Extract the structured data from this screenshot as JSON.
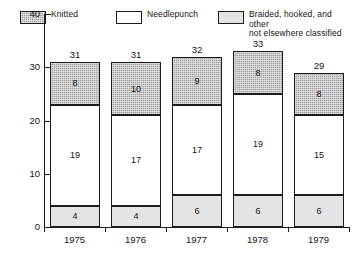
{
  "chart_data": {
    "type": "bar",
    "subtype": "stacked",
    "title": "",
    "xlabel": "",
    "ylabel": "",
    "categories": [
      "1975",
      "1976",
      "1977",
      "1978",
      "1979"
    ],
    "ylim": [
      0,
      40
    ],
    "yticks": [
      0,
      10,
      20,
      30,
      40
    ],
    "ytick_labels": [
      "0",
      "10",
      "20",
      "30",
      "40"
    ],
    "grid": false,
    "legend_position": "top",
    "series": [
      {
        "name": "Braided, hooked, and other\nnot elsewhere classified",
        "legend_key": "braided",
        "color": "#e4e4e4",
        "stack_order": 0,
        "values": [
          4,
          4,
          6,
          6,
          6
        ]
      },
      {
        "name": "Needlepunch",
        "legend_key": "needlepunch",
        "color": "#ffffff",
        "stack_order": 1,
        "values": [
          19,
          17,
          17,
          19,
          15
        ]
      },
      {
        "name": "Knitted",
        "legend_key": "knitted",
        "color": "#a0a0a0",
        "stack_order": 2,
        "values": [
          8,
          10,
          9,
          8,
          8
        ]
      }
    ],
    "totals": [
      31,
      31,
      32,
      33,
      29
    ],
    "total_labels": [
      "31",
      "31",
      "32",
      "33",
      "29"
    ]
  },
  "legend": {
    "entries": [
      {
        "label": "Knitted",
        "swatch": "knitted"
      },
      {
        "label": "Needlepunch",
        "swatch": "needlepunch"
      },
      {
        "label": "Braided, hooked, and other\nnot elsewhere classified",
        "swatch": "braided"
      }
    ]
  },
  "axis": {
    "y_labels": [
      "40",
      "30",
      "20",
      "10",
      "0"
    ],
    "x_labels": [
      "1975",
      "1976",
      "1977",
      "1978",
      "1979"
    ]
  },
  "bars": [
    {
      "category": "1975",
      "total": "31",
      "segments": [
        {
          "key": "knitted",
          "label": "8"
        },
        {
          "key": "needlepunch",
          "label": "19"
        },
        {
          "key": "braided",
          "label": "4"
        }
      ]
    },
    {
      "category": "1976",
      "total": "31",
      "segments": [
        {
          "key": "knitted",
          "label": "10"
        },
        {
          "key": "needlepunch",
          "label": "17"
        },
        {
          "key": "braided",
          "label": "4"
        }
      ]
    },
    {
      "category": "1977",
      "total": "32",
      "segments": [
        {
          "key": "knitted",
          "label": "9"
        },
        {
          "key": "needlepunch",
          "label": "17"
        },
        {
          "key": "braided",
          "label": "6"
        }
      ]
    },
    {
      "category": "1978",
      "total": "33",
      "segments": [
        {
          "key": "knitted",
          "label": "8"
        },
        {
          "key": "needlepunch",
          "label": "19"
        },
        {
          "key": "braided",
          "label": "6"
        }
      ]
    },
    {
      "category": "1979",
      "total": "29",
      "segments": [
        {
          "key": "knitted",
          "label": "8"
        },
        {
          "key": "needlepunch",
          "label": "15"
        },
        {
          "key": "braided",
          "label": "6"
        }
      ]
    }
  ]
}
